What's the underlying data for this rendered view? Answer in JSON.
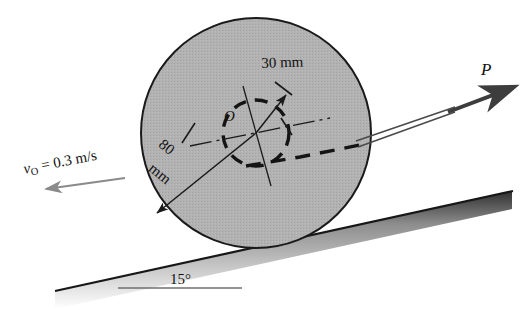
{
  "figure": {
    "name": "wheel-on-incline-free-body-diagram",
    "labels": {
      "velocity": "v",
      "velocity_sub": "O",
      "velocity_value": " = 0.3 m/s",
      "radius_hub": "30 mm",
      "radius_outer_1": "80",
      "radius_outer_2": "mm",
      "center": "O",
      "force": "P",
      "incline_angle": "15°"
    },
    "colors": {
      "wheel_fill": "#b0b0b0",
      "wheel_stroke": "#1a1a1a",
      "line": "#1a1a1a",
      "velocity_arrow": "#8a8a8a",
      "cord": "#4a4a4a",
      "ground_dark": "#2b2b2b"
    },
    "geometry": {
      "wheel_center_x": 256,
      "wheel_center_y": 133,
      "wheel_radius": 115,
      "hub_radius": 33,
      "incline_angle_deg": 15
    }
  }
}
